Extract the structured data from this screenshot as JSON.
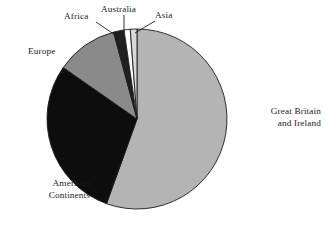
{
  "chart_data": {
    "type": "pie",
    "title": "",
    "subtitle": "",
    "xlabel": "",
    "ylabel": "",
    "legend_position": "none",
    "grid": false,
    "labels_placement": "outside-with-leader-lines",
    "start_angle_deg": 0,
    "direction": "clockwise",
    "categories": [
      "Great Britain and Ireland",
      "American Continents",
      "Europe",
      "Africa",
      "Australia",
      "Asia"
    ],
    "values": [
      55.5,
      29.2,
      11.1,
      1.9,
      1.1,
      1.2
    ],
    "units": "percent",
    "slices": [
      {
        "name": "Great Britain and Ireland",
        "label_line_1": "Great Britain",
        "label_line_2": "and Ireland",
        "value": 55.5,
        "start_angle_deg": 0,
        "end_angle_deg": 199.8,
        "color": "#b4b4b4",
        "edge_color": "#1c1c1c"
      },
      {
        "name": "American Continents",
        "label_line_1": "American",
        "label_line_2": "Continents",
        "value": 29.2,
        "start_angle_deg": 199.8,
        "end_angle_deg": 304.9,
        "color": "#0d0d0d",
        "edge_color": "#1c1c1c"
      },
      {
        "name": "Europe",
        "label_line_1": "Europe",
        "label_line_2": "",
        "value": 11.1,
        "start_angle_deg": 304.9,
        "end_angle_deg": 344.9,
        "color": "#8a8a8a",
        "edge_color": "#1c1c1c"
      },
      {
        "name": "Africa",
        "label_line_1": "Africa",
        "label_line_2": "",
        "value": 1.9,
        "start_angle_deg": 344.9,
        "end_angle_deg": 351.7,
        "color": "#1f1f1f",
        "edge_color": "#1c1c1c"
      },
      {
        "name": "Australia",
        "label_line_1": "Australia",
        "label_line_2": "",
        "value": 1.1,
        "start_angle_deg": 351.7,
        "end_angle_deg": 355.7,
        "color": "#fcfcfc",
        "edge_color": "#1c1c1c"
      },
      {
        "name": "Asia",
        "label_line_1": "Asia",
        "label_line_2": "",
        "value": 1.2,
        "start_angle_deg": 355.7,
        "end_angle_deg": 360,
        "color": "#d8d8d8",
        "edge_color": "#1c1c1c"
      }
    ],
    "colors": {
      "great_britain_and_ireland": "#b4b4b4",
      "american_continents": "#0d0d0d",
      "europe": "#8a8a8a",
      "africa": "#1f1f1f",
      "australia": "#fcfcfc",
      "asia": "#d8d8d8",
      "outline": "#1c1c1c",
      "background": "#ffffff",
      "text": "#1a1a1a"
    }
  },
  "labels": {
    "great_britain": {
      "line1": "Great Britain",
      "line2": "and Ireland"
    },
    "american": {
      "line1": "American",
      "line2": "Continents"
    },
    "europe": {
      "line1": "Europe"
    },
    "africa": {
      "line1": "Africa"
    },
    "australia": {
      "line1": "Australia"
    },
    "asia": {
      "line1": "Asia"
    }
  }
}
